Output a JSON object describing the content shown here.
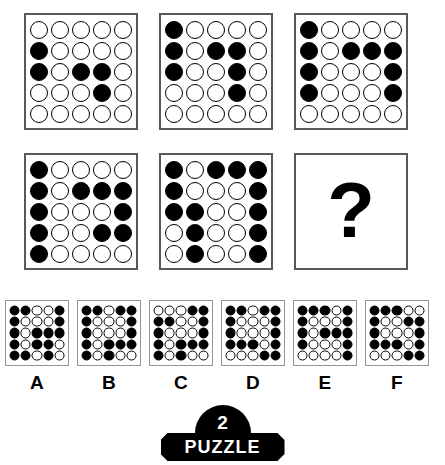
{
  "puzzle": {
    "type": "visual-matrix-reasoning",
    "grid_size": 5,
    "question_mark": "?",
    "matrix": [
      {
        "position": "row1-col1",
        "name": "matrix-cell-1",
        "rows": [
          [
            0,
            0,
            0,
            0,
            0
          ],
          [
            1,
            0,
            0,
            0,
            0
          ],
          [
            1,
            0,
            1,
            1,
            0
          ],
          [
            0,
            0,
            0,
            1,
            0
          ],
          [
            0,
            0,
            0,
            0,
            0
          ]
        ]
      },
      {
        "position": "row1-col2",
        "name": "matrix-cell-2",
        "rows": [
          [
            1,
            0,
            0,
            0,
            0
          ],
          [
            1,
            0,
            1,
            1,
            0
          ],
          [
            1,
            0,
            0,
            1,
            0
          ],
          [
            0,
            0,
            0,
            1,
            0
          ],
          [
            0,
            0,
            0,
            0,
            0
          ]
        ]
      },
      {
        "position": "row1-col3",
        "name": "matrix-cell-3",
        "rows": [
          [
            1,
            0,
            0,
            0,
            0
          ],
          [
            1,
            0,
            1,
            1,
            1
          ],
          [
            1,
            0,
            0,
            0,
            1
          ],
          [
            1,
            0,
            0,
            0,
            1
          ],
          [
            0,
            0,
            0,
            0,
            0
          ]
        ]
      },
      {
        "position": "row2-col1",
        "name": "matrix-cell-4",
        "rows": [
          [
            1,
            0,
            0,
            0,
            0
          ],
          [
            1,
            0,
            1,
            1,
            1
          ],
          [
            1,
            0,
            0,
            0,
            1
          ],
          [
            1,
            0,
            0,
            1,
            1
          ],
          [
            1,
            0,
            0,
            0,
            0
          ]
        ]
      },
      {
        "position": "row2-col2",
        "name": "matrix-cell-5",
        "rows": [
          [
            1,
            0,
            1,
            1,
            1
          ],
          [
            1,
            0,
            0,
            0,
            1
          ],
          [
            1,
            1,
            0,
            0,
            1
          ],
          [
            0,
            1,
            0,
            0,
            1
          ],
          [
            0,
            1,
            0,
            0,
            1
          ]
        ]
      }
    ],
    "options": [
      {
        "label": "A",
        "name": "option-a",
        "rows": [
          [
            1,
            1,
            0,
            0,
            1
          ],
          [
            1,
            0,
            0,
            0,
            1
          ],
          [
            1,
            0,
            1,
            1,
            1
          ],
          [
            1,
            0,
            1,
            1,
            0
          ],
          [
            1,
            1,
            0,
            1,
            0
          ]
        ]
      },
      {
        "label": "B",
        "name": "option-b",
        "rows": [
          [
            1,
            1,
            0,
            1,
            1
          ],
          [
            1,
            0,
            0,
            0,
            1
          ],
          [
            1,
            0,
            0,
            0,
            1
          ],
          [
            1,
            0,
            1,
            1,
            1
          ],
          [
            1,
            0,
            1,
            0,
            0
          ]
        ]
      },
      {
        "label": "C",
        "name": "option-c",
        "rows": [
          [
            0,
            0,
            0,
            1,
            1
          ],
          [
            1,
            1,
            0,
            0,
            1
          ],
          [
            1,
            0,
            0,
            0,
            1
          ],
          [
            1,
            0,
            1,
            1,
            1
          ],
          [
            1,
            0,
            1,
            0,
            0
          ]
        ]
      },
      {
        "label": "D",
        "name": "option-d",
        "rows": [
          [
            1,
            1,
            0,
            1,
            1
          ],
          [
            1,
            0,
            0,
            0,
            1
          ],
          [
            1,
            0,
            0,
            0,
            1
          ],
          [
            1,
            1,
            1,
            0,
            1
          ],
          [
            0,
            0,
            0,
            1,
            1
          ]
        ]
      },
      {
        "label": "E",
        "name": "option-e",
        "rows": [
          [
            1,
            1,
            1,
            0,
            1
          ],
          [
            1,
            0,
            0,
            0,
            1
          ],
          [
            1,
            0,
            1,
            1,
            1
          ],
          [
            1,
            0,
            0,
            0,
            1
          ],
          [
            0,
            0,
            0,
            0,
            1
          ]
        ]
      },
      {
        "label": "F",
        "name": "option-f",
        "rows": [
          [
            1,
            1,
            1,
            0,
            0
          ],
          [
            1,
            0,
            0,
            1,
            1
          ],
          [
            1,
            0,
            0,
            0,
            1
          ],
          [
            1,
            1,
            1,
            0,
            1
          ],
          [
            0,
            0,
            0,
            1,
            1
          ]
        ]
      }
    ]
  },
  "badge": {
    "number": "2",
    "word": "PUZZLE"
  },
  "colors": {
    "dot_fill": "#000000",
    "dot_stroke": "#000000",
    "matrix_border": "#58595b",
    "option_border": "#939598",
    "badge_bg": "#000000",
    "badge_text": "#ffffff",
    "background": "#ffffff"
  }
}
